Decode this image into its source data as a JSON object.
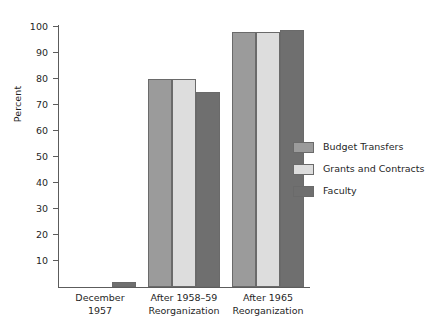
{
  "chart_data": {
    "type": "bar",
    "title": "",
    "xlabel": "",
    "ylabel": "Percent",
    "ylim": [
      0,
      100
    ],
    "grid": false,
    "legend_position": "right",
    "categories": [
      "December\n1957",
      "After 1958–59\nReorganization",
      "After 1965\nReorganization"
    ],
    "yticks": [
      100,
      90,
      80,
      70,
      60,
      50,
      40,
      30,
      20,
      10
    ],
    "series": [
      {
        "name": "Budget Transfers",
        "color": "#9b9b9b",
        "values": [
          0,
          80,
          98
        ]
      },
      {
        "name": "Grants and Contracts",
        "color": "#dddddd",
        "values": [
          0,
          80,
          98
        ]
      },
      {
        "name": "Faculty",
        "color": "#6f6f6f",
        "values": [
          2,
          75,
          99
        ]
      }
    ]
  },
  "axis": {
    "y_title": "Percent"
  },
  "legend": {
    "items": [
      {
        "label": "Budget Transfers",
        "color": "#9b9b9b"
      },
      {
        "label": "Grants and Contracts",
        "color": "#dddddd"
      },
      {
        "label": "Faculty",
        "color": "#6f6f6f"
      }
    ]
  }
}
